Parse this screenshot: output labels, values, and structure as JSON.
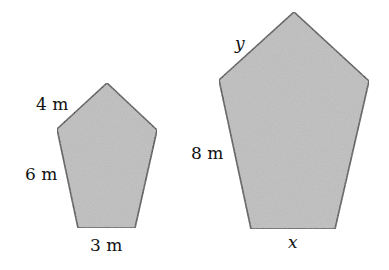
{
  "figure": {
    "fill_color": "#b8b8b8",
    "stroke_color": "#333333",
    "small_pentagon": {
      "vertices": [
        [
          107,
          83
        ],
        [
          157,
          130
        ],
        [
          135,
          228
        ],
        [
          78,
          228
        ],
        [
          57,
          129
        ]
      ],
      "labels": {
        "top_left_side": "4 m",
        "left_side": "6 m",
        "bottom_side": "3 m"
      }
    },
    "large_pentagon": {
      "vertices": [
        [
          294,
          12
        ],
        [
          369,
          81
        ],
        [
          335,
          229
        ],
        [
          251,
          229
        ],
        [
          219,
          80
        ]
      ],
      "labels": {
        "top_left_side": "y",
        "left_side": "8 m",
        "bottom_side": "x"
      }
    }
  }
}
